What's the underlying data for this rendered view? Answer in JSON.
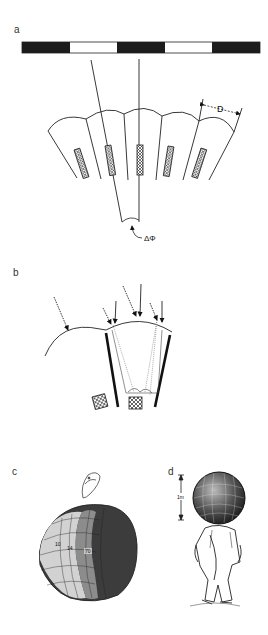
{
  "figure": {
    "panels": [
      {
        "id": "a",
        "label": "a",
        "description": "Striped grating above a fan of ommatidia",
        "grating_segments": [
          "black",
          "white",
          "black",
          "white",
          "black"
        ],
        "dimension_label": "D",
        "angle_label": "ΔΦ"
      },
      {
        "id": "b",
        "label": "b",
        "description": "Light rays entering a single facet with pigment walls"
      },
      {
        "id": "c",
        "label": "c",
        "description": "Compound eye with mapped regions",
        "region_labels": [
          "10",
          "14",
          "70"
        ]
      },
      {
        "id": "d",
        "label": "d",
        "description": "Human figure with giant compound eye head",
        "scale_label": "1m"
      }
    ],
    "colors": {
      "ink": "#1a1a1a",
      "dark_region": "#3a3a3a",
      "mid_region": "#8a8a8a",
      "light_region": "#cfcfcf",
      "background": "#ffffff"
    }
  }
}
